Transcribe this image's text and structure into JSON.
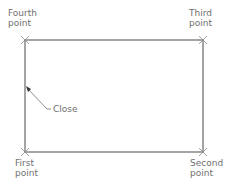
{
  "diagram": {
    "title": "",
    "labels": {
      "fourth": "Fourth\npoint",
      "third": "Third\npoint",
      "first": "First\npoint",
      "second": "Second\npoint",
      "close": "Close"
    },
    "colors": {
      "line": "#4a4a4a",
      "text": "#6f6f6f",
      "marker": "#8a8a8a"
    },
    "rectangle": {
      "x1": 25,
      "y1": 40,
      "x2": 203,
      "y2": 152
    }
  }
}
